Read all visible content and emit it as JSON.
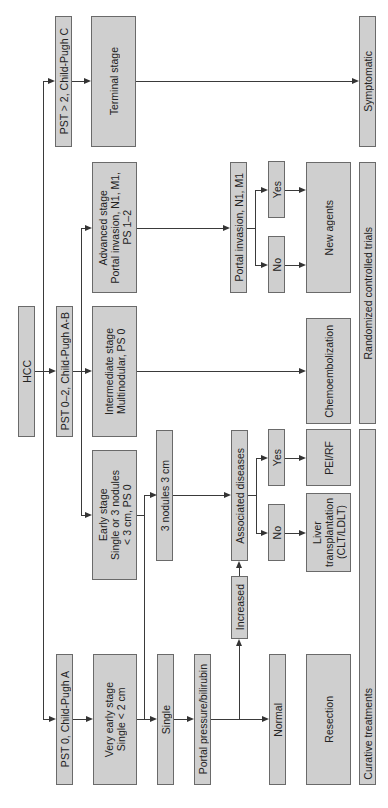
{
  "diagram": {
    "root": "HCC",
    "branches": {
      "pst0": "PST 0, Child-Pugh A",
      "pst02": "PST 0–2, Child-Pugh A-B",
      "pst2": "PST > 2, Child-Pugh C"
    },
    "stages": {
      "very_early": "Very early stage\nSingle < 2 cm",
      "early": "Early stage\nSingle or 3 nodules\n< 3 cm, PS 0",
      "intermediate": "Intermediate stage\nMultinodular, PS 0",
      "advanced": "Advanced stage\nPortal invasion, N1, M1,\nPS 1–2",
      "terminal": "Terminal stage"
    },
    "nodes": {
      "single": "Single",
      "three_nodules": "3 nodules  3 cm",
      "portal_pressure": "Portal pressure/bilirubin",
      "increased": "Increased",
      "associated_diseases": "Associated diseases",
      "portal_invasion": "Portal invasion, N1, M1",
      "normal": "Normal",
      "no_assoc": "No",
      "yes_assoc": "Yes",
      "no_portal": "No",
      "yes_portal": "Yes"
    },
    "treatments": {
      "resection": "Resection",
      "liver_transplant": "Liver\ntransplantation\n(CLT/LDLT)",
      "pei_rf": "PEI/RF",
      "chemoembolization": "Chemoembolization",
      "new_agents": "New agents",
      "symptomatic": "Symptomatic"
    },
    "categories": {
      "curative": "Curative treatments",
      "rct": "Randomized controlled trials",
      "symptomatic": "Symptomatic"
    }
  }
}
